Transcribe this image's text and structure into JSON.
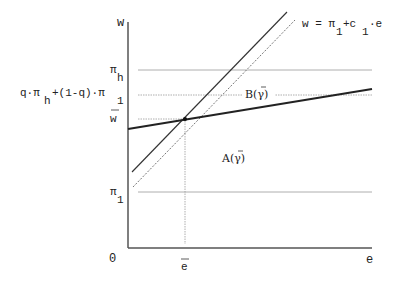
{
  "diagram": {
    "axes": {
      "y_label": "w",
      "x_label": "e",
      "origin_label": "0"
    },
    "y_ticks": {
      "pi_h": {
        "symbol": "π",
        "sub": "h"
      },
      "q_mix": {
        "prefix": "q·π",
        "sub1": "h",
        "middle": "+(1-q)·π",
        "sub2": "1"
      },
      "w_bar": {
        "symbol": "w"
      },
      "pi_1": {
        "symbol": "π",
        "sub": "1"
      }
    },
    "x_ticks": {
      "e_bar": {
        "symbol": "e"
      }
    },
    "curve_label": {
      "lhs": "w = π",
      "sub1": "1",
      "mid": "+c",
      "sub2": "1",
      "rhs": "·e"
    },
    "regions": {
      "B": "B(γ)",
      "A": "A(γ)"
    },
    "colors": {
      "axis": "#555555",
      "solid_line": "#333333",
      "dotted_line": "#777777",
      "guide_line": "#999999",
      "thick_line": "#222222"
    }
  }
}
